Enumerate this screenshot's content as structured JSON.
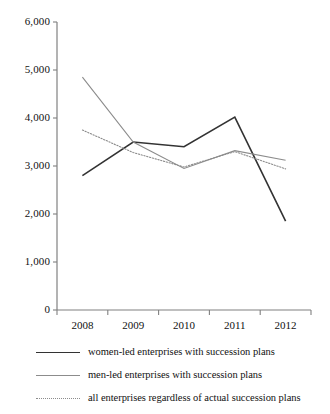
{
  "chart_data": {
    "type": "line",
    "title": "",
    "subtitle": "",
    "xlabel": "",
    "ylabel": "",
    "categories": [
      "2008",
      "2009",
      "2010",
      "2011",
      "2012"
    ],
    "ylim": [
      0,
      6000
    ],
    "ytick_values": [
      0,
      1000,
      2000,
      3000,
      4000,
      5000,
      6000
    ],
    "ytick_labels": [
      "0",
      "1,000",
      "2,000",
      "3,000",
      "4,000",
      "5,000",
      "6,000"
    ],
    "grid": false,
    "legend_position": "bottom",
    "series": [
      {
        "name": "women-led enterprises with succession plans",
        "style": "solid",
        "color": "#333333",
        "width": 1.6,
        "values": [
          2800,
          3500,
          3400,
          4020,
          1850
        ]
      },
      {
        "name": "men-led enterprises with succession plans",
        "style": "solid",
        "color": "#8c8c8c",
        "width": 1.1,
        "values": [
          4850,
          3500,
          2950,
          3320,
          3120
        ]
      },
      {
        "name": "all enterprises regardless of actual succession plans",
        "style": "dotted",
        "color": "#8c8c8c",
        "width": 1.1,
        "values": [
          3750,
          3280,
          2980,
          3300,
          2940
        ]
      }
    ]
  },
  "axes": {
    "axis_color": "#808080",
    "tick_color": "#808080"
  },
  "legend": {
    "items": [
      {
        "label": "women-led enterprises with succession plans",
        "swatch": "solid-dark-line-icon"
      },
      {
        "label": "men-led enterprises with succession plans",
        "swatch": "solid-gray-line-icon"
      },
      {
        "label": "all enterprises regardless of actual succession plans",
        "swatch": "dotted-gray-line-icon"
      }
    ]
  }
}
